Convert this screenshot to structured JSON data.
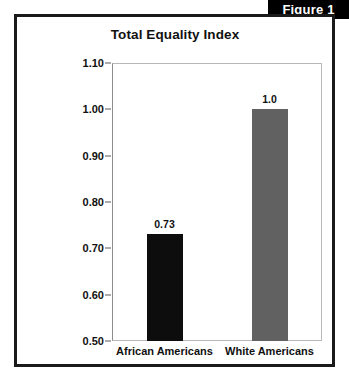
{
  "figure": {
    "tab_label": "Figure 1"
  },
  "chart_data": {
    "type": "bar",
    "title": "Total Equality Index",
    "xlabel": "",
    "ylabel": "",
    "ylim": [
      0.5,
      1.1
    ],
    "yticks": [
      "1.10",
      "1.00",
      "0.90",
      "0.80",
      "0.70",
      "0.60",
      "0.50"
    ],
    "grid": false,
    "legend": "none",
    "categories": [
      "African Americans",
      "White Americans"
    ],
    "values": [
      0.73,
      1.0
    ],
    "value_labels": [
      "0.73",
      "1.0"
    ],
    "colors": [
      "#0d0d0d",
      "#616161"
    ]
  }
}
